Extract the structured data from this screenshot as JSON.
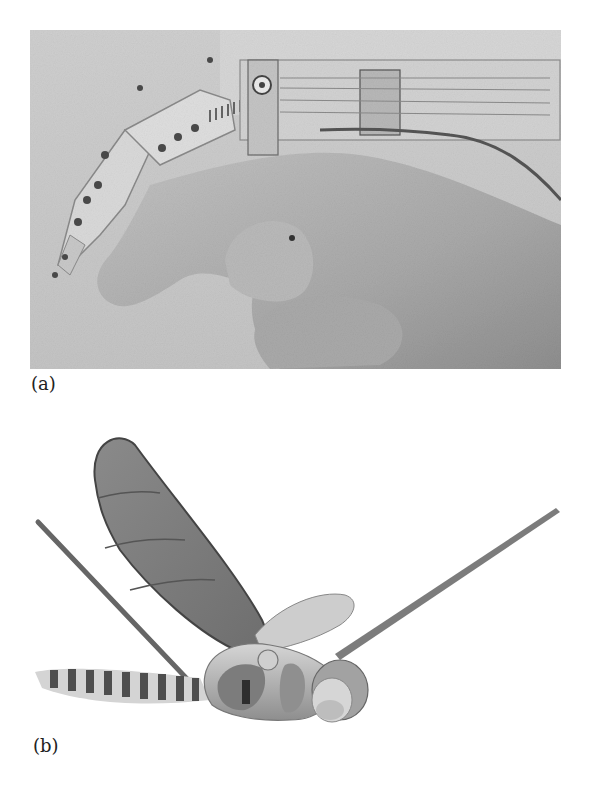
{
  "figure": {
    "panels": [
      {
        "label": "(a)",
        "subject": "robotic finger exoskeleton mounted on human hand",
        "tone": "grayscale photo",
        "colors": {
          "background": "#c9c9c9",
          "skin": "#b5b5b5",
          "metal": "#d8d8d8",
          "dark": "#555555"
        }
      },
      {
        "label": "(b)",
        "subject": "robotic dragonfly with wings and striped abdomen",
        "tone": "grayscale photo",
        "colors": {
          "wing_dark": "#7a7a7a",
          "wing_light": "#cfcfcf",
          "body": "#9a9a9a",
          "stripe": "#4a4a4a"
        }
      }
    ]
  }
}
